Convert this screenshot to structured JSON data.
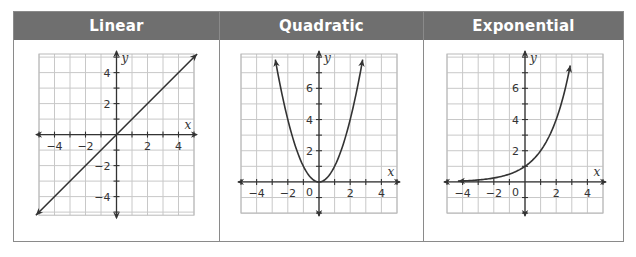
{
  "colors": {
    "header_bg": "#6f6f6f",
    "header_text": "#ffffff",
    "grid": "#c8c8c8",
    "axis": "#333333",
    "curve": "#333333",
    "border": "#8a8a8a"
  },
  "panels": [
    {
      "id": "linear",
      "label": "Linear",
      "function": "y = x",
      "x_axis_label": "x",
      "y_axis_label": "y",
      "xlim": [
        -5,
        5
      ],
      "ylim": [
        -5.2,
        5.2
      ],
      "x_ticks": [
        -4,
        -2,
        2,
        4
      ],
      "y_ticks": [
        -4,
        -2,
        2,
        4
      ],
      "show_origin_label": false,
      "points": [
        [
          -5.2,
          -5.2
        ],
        [
          5.2,
          5.2
        ]
      ]
    },
    {
      "id": "quadratic",
      "label": "Quadratic",
      "function": "y = x^2",
      "x_axis_label": "x",
      "y_axis_label": "y",
      "xlim": [
        -5,
        5
      ],
      "ylim": [
        -2,
        8.2
      ],
      "x_ticks": [
        -4,
        -2,
        2,
        4
      ],
      "y_ticks": [
        2,
        4,
        6
      ],
      "show_origin_label": true,
      "origin_label": "0",
      "points": [
        [
          -2.8,
          7.84
        ],
        [
          -2,
          4
        ],
        [
          -1,
          1
        ],
        [
          0,
          0
        ],
        [
          1,
          1
        ],
        [
          2,
          4
        ],
        [
          2.8,
          7.84
        ]
      ]
    },
    {
      "id": "exponential",
      "label": "Exponential",
      "function": "y = 2^x",
      "x_axis_label": "x",
      "y_axis_label": "y",
      "xlim": [
        -5,
        5
      ],
      "ylim": [
        -2,
        8.2
      ],
      "x_ticks": [
        -4,
        -2,
        2,
        4
      ],
      "y_ticks": [
        2,
        4,
        6
      ],
      "show_origin_label": true,
      "origin_label": "0",
      "points": [
        [
          -4.3,
          0.05
        ],
        [
          -2,
          0.25
        ],
        [
          -1,
          0.5
        ],
        [
          0,
          1
        ],
        [
          1,
          2
        ],
        [
          2,
          4
        ],
        [
          2.9,
          7.46
        ]
      ]
    }
  ],
  "chart_data": [
    {
      "type": "line",
      "title": "Linear",
      "xlabel": "x",
      "ylabel": "y",
      "x": [
        -5,
        -4,
        -2,
        0,
        2,
        4,
        5
      ],
      "values": [
        -5,
        -4,
        -2,
        0,
        2,
        4,
        5
      ],
      "xlim": [
        -5,
        5
      ],
      "ylim": [
        -5,
        5
      ],
      "x_ticks": [
        -4,
        -2,
        2,
        4
      ],
      "y_ticks": [
        -4,
        -2,
        2,
        4
      ],
      "grid": true
    },
    {
      "type": "line",
      "title": "Quadratic",
      "xlabel": "x",
      "ylabel": "y",
      "x": [
        -2.8,
        -2,
        -1,
        0,
        1,
        2,
        2.8
      ],
      "values": [
        7.84,
        4,
        1,
        0,
        1,
        4,
        7.84
      ],
      "xlim": [
        -5,
        5
      ],
      "ylim": [
        -2,
        8
      ],
      "x_ticks": [
        -4,
        -2,
        0,
        2,
        4
      ],
      "y_ticks": [
        2,
        4,
        6
      ],
      "grid": true
    },
    {
      "type": "line",
      "title": "Exponential",
      "xlabel": "x",
      "ylabel": "y",
      "x": [
        -4,
        -2,
        -1,
        0,
        1,
        2,
        2.9
      ],
      "values": [
        0.0625,
        0.25,
        0.5,
        1,
        2,
        4,
        7.46
      ],
      "xlim": [
        -5,
        5
      ],
      "ylim": [
        -2,
        8
      ],
      "x_ticks": [
        -4,
        -2,
        0,
        2,
        4
      ],
      "y_ticks": [
        2,
        4,
        6
      ],
      "grid": true
    }
  ]
}
